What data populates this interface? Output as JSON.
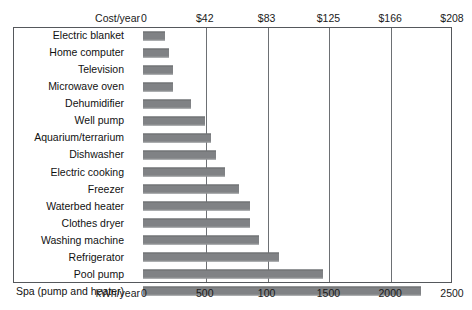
{
  "chart_data": {
    "type": "bar",
    "orientation": "horizontal",
    "title": "",
    "xlabel": "kWh/year",
    "xlabel_secondary": "Cost/year",
    "ylabel": "",
    "xlim": [
      0,
      2500
    ],
    "xlim_secondary": [
      0,
      208
    ],
    "grid": true,
    "legend": false,
    "categories": [
      "Electric blanket",
      "Home computer",
      "Television",
      "Microwave oven",
      "Dehumidifier",
      "Well pump",
      "Aquarium/terrarium",
      "Dishwasher",
      "Electric cooking",
      "Freezer",
      "Waterbed heater",
      "Clothes dryer",
      "Washing machine",
      "Refrigerator",
      "Pool pump",
      "Spa (pump and heater)"
    ],
    "values": [
      175,
      210,
      245,
      245,
      390,
      500,
      550,
      590,
      660,
      775,
      865,
      865,
      940,
      1100,
      1460,
      2250
    ],
    "units": "kWh/year",
    "cost_axis": {
      "label": "Cost/year",
      "ticks": [
        "0",
        "$42",
        "$83",
        "$125",
        "$166",
        "$208"
      ],
      "tick_values": [
        0,
        42,
        83,
        125,
        166,
        208
      ],
      "positions_pct": [
        0,
        20,
        40,
        60,
        80,
        100
      ]
    },
    "kwh_axis": {
      "label": "kWh/year",
      "ticks": [
        "0",
        "500",
        "100",
        "1500",
        "2000",
        "2500"
      ],
      "tick_values": [
        0,
        500,
        1000,
        1500,
        2000,
        2500
      ],
      "positions_pct": [
        0,
        20,
        40,
        60,
        80,
        100
      ]
    },
    "gridline_positions_pct": [
      20,
      40,
      60,
      80
    ],
    "bar_color": "#808285",
    "frame_color": "#55585c"
  }
}
